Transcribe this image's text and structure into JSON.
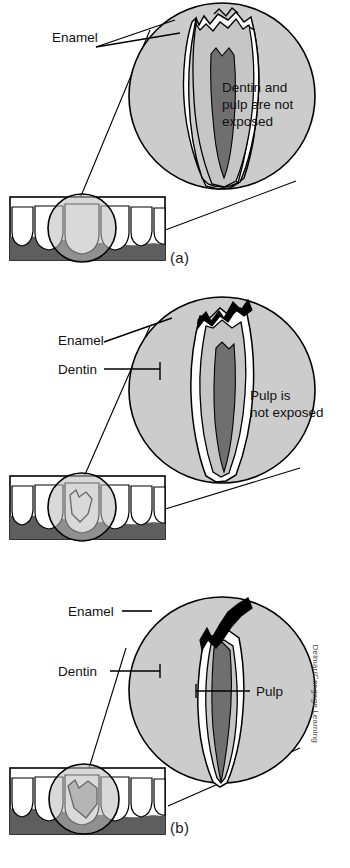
{
  "figure": {
    "credit": "Delmar/Cengage Learning"
  },
  "colors": {
    "circle_fill": "#cccccc",
    "enamel_fill": "#ffffff",
    "dentin_fill": "#c6c6c6",
    "pulp_fill": "#6f6f6f",
    "gum_fill": "#5e5e5e",
    "fracture_fill": "#000000",
    "outline": "#000000",
    "text": "#111111"
  },
  "panels": [
    {
      "id": "a",
      "label": "(a)",
      "condition": "enamel-only-chip",
      "annotations": [
        {
          "name": "enamel",
          "text": "Enamel",
          "x": 52,
          "y": 42
        },
        {
          "name": "status",
          "text": "Dentin and",
          "x": 222,
          "y": 92
        },
        {
          "name": "status-line2",
          "text": "pulp are not",
          "x": 222,
          "y": 109
        },
        {
          "name": "status-line3",
          "text": "exposed",
          "x": 222,
          "y": 126
        }
      ],
      "status_text": "Dentin and pulp are not exposed"
    },
    {
      "id": "b",
      "label": "(b)",
      "condition": "fracture-into-dentin",
      "annotations": [
        {
          "name": "enamel",
          "text": "Enamel",
          "x": 58,
          "y": 55
        },
        {
          "name": "dentin",
          "text": "Dentin",
          "x": 58,
          "y": 82
        },
        {
          "name": "status",
          "text": "Pulp is",
          "x": 250,
          "y": 110
        },
        {
          "name": "status-line2",
          "text": "not exposed",
          "x": 250,
          "y": 127
        }
      ],
      "status_text": "Pulp is not exposed"
    },
    {
      "id": "c",
      "label": "(c)",
      "condition": "fracture-exposing-pulp",
      "annotations": [
        {
          "name": "enamel",
          "text": "Enamel",
          "x": 72,
          "y": 37
        },
        {
          "name": "dentin",
          "text": "Dentin",
          "x": 62,
          "y": 97
        },
        {
          "name": "pulp",
          "text": "Pulp",
          "x": 258,
          "y": 116
        }
      ],
      "status_text": "Pulp exposed"
    }
  ]
}
